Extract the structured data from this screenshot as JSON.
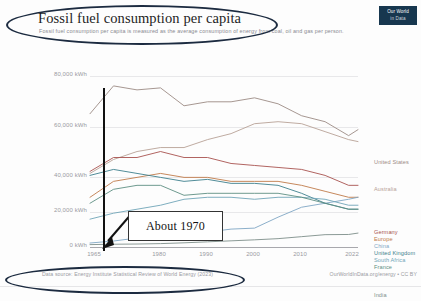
{
  "header": {
    "title": "Fossil fuel consumption per capita",
    "subtitle": "Fossil fuel consumption per capita is measured as the average consumption of energy from coal, oil and gas per person.",
    "logo_line1": "Our World",
    "logo_line2": "in Data"
  },
  "footer": {
    "source": "Data source: Energy Institute Statistical Review of World Energy (2023)",
    "attribution": "OurWorldInData.org/energy • CC BY"
  },
  "annotations": {
    "callout_label": "About 1970",
    "vertical_marker_year": 1970,
    "ink_ellipse_title": "hand-drawn ellipse around chart title",
    "ink_ellipse_source": "hand-drawn ellipse around data source"
  },
  "chart_data": {
    "type": "line",
    "title": "Fossil fuel consumption per capita",
    "subtitle": "Fossil fuel consumption per capita is measured as the average consumption of energy from coal, oil and gas per person.",
    "xlabel": "",
    "ylabel": "",
    "unit": "kWh",
    "xlim": [
      1965,
      2022
    ],
    "ylim": [
      0,
      90000
    ],
    "grid": true,
    "legend_position": "right-inline",
    "ytick_labels": [
      "0 kWh",
      "20,000 kWh",
      "40,000 kWh",
      "60,000 kWh",
      "80,000 kWh"
    ],
    "ytick_values": [
      0,
      20000,
      40000,
      60000,
      80000
    ],
    "xtick_labels": [
      "1965",
      "1980",
      "1990",
      "2000",
      "2010",
      "2022"
    ],
    "xtick_values": [
      1965,
      1980,
      1990,
      2000,
      2010,
      2022
    ],
    "x": [
      1965,
      1970,
      1975,
      1980,
      1985,
      1990,
      1995,
      2000,
      2005,
      2010,
      2015,
      2020,
      2022
    ],
    "series": [
      {
        "name": "United States",
        "color": "#9c8b85",
        "values": [
          67000,
          81000,
          79000,
          80000,
          71000,
          73000,
          73000,
          75000,
          72000,
          66000,
          63000,
          56000,
          59000
        ]
      },
      {
        "name": "Australia",
        "color": "#b8a296",
        "values": [
          37000,
          44000,
          48000,
          50000,
          50000,
          54000,
          57000,
          62000,
          63000,
          62000,
          58000,
          54000,
          53000
        ]
      },
      {
        "name": "Germany",
        "color": "#a8524f",
        "values": [
          38000,
          45000,
          45000,
          48000,
          45000,
          45000,
          42000,
          41000,
          40000,
          39000,
          36000,
          31000,
          31000
        ]
      },
      {
        "name": "Europe",
        "color": "#c07a4a",
        "values": [
          25000,
          33000,
          35000,
          37000,
          35000,
          35000,
          33000,
          33000,
          33000,
          31000,
          28000,
          25000,
          25000
        ]
      },
      {
        "name": "China",
        "color": "#7fa6c4",
        "values": [
          2000,
          3000,
          4500,
          5000,
          6500,
          7500,
          9000,
          9500,
          15000,
          20000,
          22000,
          24000,
          25000
        ]
      },
      {
        "name": "United Kingdom",
        "color": "#3d7f8c",
        "values": [
          36000,
          39000,
          37000,
          35000,
          33000,
          34000,
          32000,
          32000,
          31000,
          27000,
          22000,
          19000,
          19000
        ]
      },
      {
        "name": "South Africa",
        "color": "#6fa5b8",
        "values": [
          14000,
          17000,
          19000,
          21000,
          24000,
          25000,
          25000,
          24000,
          25000,
          25000,
          24000,
          21000,
          21000
        ]
      },
      {
        "name": "France",
        "color": "#5d8f82",
        "values": [
          22000,
          29000,
          31000,
          31000,
          26000,
          27000,
          27000,
          27000,
          27000,
          25000,
          22000,
          19000,
          19000
        ]
      },
      {
        "name": "India",
        "color": "#7e8f8a",
        "values": [
          1200,
          1400,
          1500,
          1700,
          2100,
          2600,
          3100,
          3600,
          4200,
          5200,
          6200,
          6300,
          7000
        ]
      }
    ],
    "annotation": {
      "label": "About 1970",
      "marker_x": 1970,
      "marker_type": "vertical-line"
    }
  },
  "legend": [
    {
      "label": "United States",
      "color": "#9c8b85",
      "top": 107
    },
    {
      "label": "Australia",
      "color": "#b8a296",
      "top": 134
    },
    {
      "label": "Germany",
      "color": "#a8524f",
      "top": 177
    },
    {
      "label": "Europe",
      "color": "#c07a4a",
      "top": 184
    },
    {
      "label": "China",
      "color": "#7fa6c4",
      "top": 191
    },
    {
      "label": "United Kingdom",
      "color": "#3d7f8c",
      "top": 198
    },
    {
      "label": "South Africa",
      "color": "#6fa5b8",
      "top": 205
    },
    {
      "label": "France",
      "color": "#5d8f82",
      "top": 212
    },
    {
      "label": "India",
      "color": "#7e8f8a",
      "top": 240
    }
  ]
}
